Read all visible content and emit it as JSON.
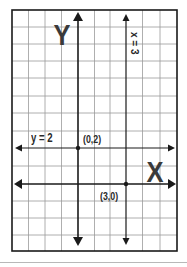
{
  "diagram": {
    "type": "coordinate-plane",
    "axis_labels": {
      "x": "X",
      "y": "Y"
    },
    "lines": [
      {
        "label": "y = 2",
        "orientation": "horizontal"
      },
      {
        "label": "x = 3",
        "orientation": "vertical"
      }
    ],
    "points": [
      {
        "label": "(0,2)"
      },
      {
        "label": "(3,0)"
      }
    ],
    "colors": {
      "line": "#1a1a1a",
      "grid": "#9a9a9a",
      "text": "#2a2a2a"
    }
  }
}
